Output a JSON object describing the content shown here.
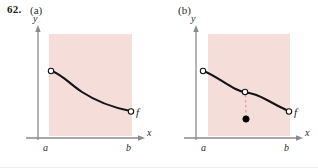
{
  "figure": {
    "exercise_number": "62.",
    "background_color": "#ffffff",
    "width": 318,
    "height": 168
  },
  "style": {
    "shade_fill": "#f5ddda",
    "curve_color": "#141414",
    "axis_color": "#8a8a8a",
    "dash_color": "#e0a9a2",
    "open_point_fill": "#ffffff",
    "closed_point_fill": "#000000"
  },
  "panels": [
    {
      "id": "panel-a",
      "label": "(a)",
      "axes": {
        "y_label": "y",
        "x_label": "x",
        "left_tick_label": "a",
        "right_tick_label": "b"
      },
      "function_label": "f",
      "description": "continuous decreasing curve from open point at a to open point at b",
      "shaded_region": {
        "x": 49,
        "y": 34,
        "width": 83,
        "height": 102
      },
      "curve_endpoints": {
        "start": {
          "x": 51,
          "y": 71,
          "type": "open"
        },
        "end": {
          "x": 131,
          "y": 111,
          "type": "open"
        }
      },
      "discontinuity": null
    },
    {
      "id": "panel-b",
      "label": "(b)",
      "axes": {
        "y_label": "y",
        "x_label": "x",
        "left_tick_label": "a",
        "right_tick_label": "b"
      },
      "function_label": "f",
      "description": "decreasing curve with a removable discontinuity: open point on the curve with dashed drop to a filled point below",
      "shaded_region": {
        "x": 208,
        "y": 34,
        "width": 82,
        "height": 102
      },
      "curve_endpoints": {
        "start": {
          "x": 203,
          "y": 71,
          "type": "open"
        },
        "end": {
          "x": 289,
          "y": 111,
          "type": "open"
        }
      },
      "discontinuity": {
        "open_point": {
          "x": 245,
          "y": 92
        },
        "closed_point": {
          "x": 246,
          "y": 119
        },
        "connector": "dashed"
      }
    }
  ]
}
